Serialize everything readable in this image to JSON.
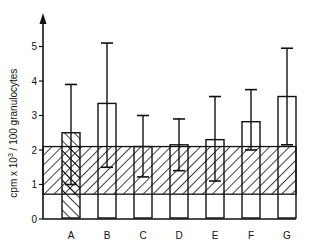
{
  "chart_data": {
    "type": "bar",
    "title": "",
    "xlabel": "",
    "ylabel": "cpm x 10^3 / 100 granulocytes",
    "ylabel_parts": {
      "pre": "cpm x 10",
      "sup": "3",
      "post": " / 100 granulocytes"
    },
    "ylim": [
      0,
      5.8
    ],
    "yticks": [
      0,
      1,
      2,
      3,
      4,
      5
    ],
    "grid": false,
    "legend": null,
    "categories": [
      "A",
      "B",
      "C",
      "D",
      "E",
      "F",
      "G"
    ],
    "values": [
      2.5,
      3.35,
      2.1,
      2.15,
      2.3,
      2.82,
      3.55
    ],
    "error_upper": [
      3.9,
      5.1,
      3.0,
      2.9,
      3.55,
      3.75,
      4.95
    ],
    "error_lower": [
      1.0,
      1.5,
      1.22,
      1.4,
      1.1,
      2.0,
      2.15
    ],
    "bar_fill": [
      "hatched",
      "open",
      "open",
      "open",
      "open",
      "open",
      "open"
    ],
    "reference_band": {
      "low": 0.72,
      "high": 2.1,
      "fill": "hatched"
    }
  }
}
